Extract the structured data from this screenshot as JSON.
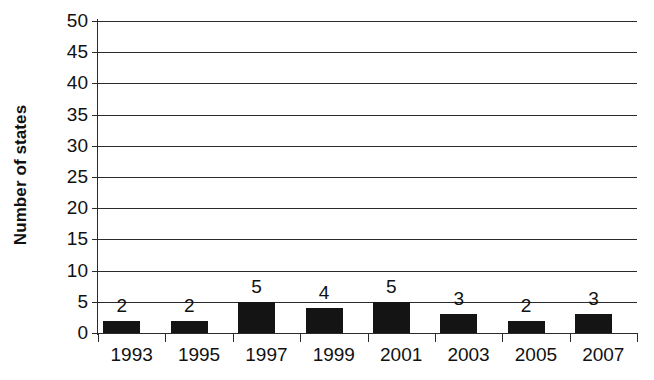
{
  "chart_data": {
    "type": "bar",
    "title": "",
    "subtitle": "",
    "xlabel": "",
    "ylabel": "Number of states",
    "categories": [
      "1993",
      "1995",
      "1997",
      "1999",
      "2001",
      "2003",
      "2005",
      "2007"
    ],
    "values": [
      2,
      2,
      5,
      4,
      5,
      3,
      2,
      3
    ],
    "data_labels": [
      "2",
      "2",
      "5",
      "4",
      "5",
      "3",
      "2",
      "3"
    ],
    "ylim": [
      0,
      50
    ],
    "ytick_step": 5,
    "ytick_labels": [
      "0",
      "5",
      "10",
      "15",
      "20",
      "25",
      "30",
      "35",
      "40",
      "45",
      "50"
    ],
    "grid": true,
    "grid_axis": "y",
    "legend": false,
    "legend_position": "none",
    "series": [
      {
        "name": "Number of states",
        "values": [
          2,
          2,
          5,
          4,
          5,
          3,
          2,
          3
        ]
      }
    ],
    "colors": {
      "bar": "#141414",
      "axis": "#2b2b2b",
      "grid": "#2b2b2b",
      "text": "#111111",
      "background": "#ffffff"
    }
  }
}
